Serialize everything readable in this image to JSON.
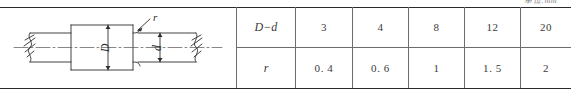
{
  "figure": {
    "unit_caption": "单位:mm",
    "drawing": {
      "name": "stepped-shaft-fillet-diagram",
      "labels": {
        "large_diameter": "D",
        "small_diameter": "d",
        "fillet_radius": "r"
      }
    }
  },
  "table": {
    "row_labels": {
      "diameter_difference": "D−d",
      "radius": "r"
    },
    "columns": [
      {
        "diameter_difference": "3",
        "radius": "0. 4"
      },
      {
        "diameter_difference": "4",
        "radius": "0. 6"
      },
      {
        "diameter_difference": "8",
        "radius": "1"
      },
      {
        "diameter_difference": "12",
        "radius": "1. 5"
      },
      {
        "diameter_difference": "20",
        "radius": "2"
      }
    ]
  },
  "colors": {
    "rule": "#2b2b2b",
    "grid": "#6d6d6d",
    "line_art": "#2e2e2e",
    "text": "#3a3a3a"
  }
}
